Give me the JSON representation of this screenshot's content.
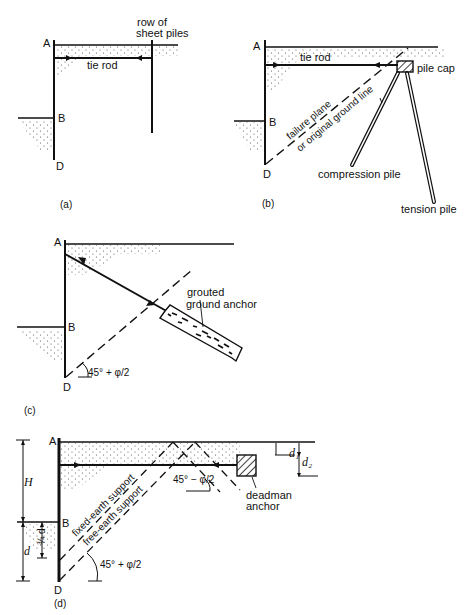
{
  "figure": {
    "panels": [
      {
        "id": "a",
        "caption": "(a)",
        "points": {
          "A": "A",
          "B": "B",
          "D": "D"
        },
        "labels": {
          "row_of_line1": "row of",
          "row_of_line2": "sheet piles",
          "tie_rod": "tie rod"
        }
      },
      {
        "id": "b",
        "caption": "(b)",
        "points": {
          "A": "A",
          "B": "B",
          "D": "D"
        },
        "labels": {
          "tie_rod": "tie rod",
          "pile_cap": "pile cap",
          "failure_plane_line1": "failure plane",
          "failure_plane_line2": "or original ground line",
          "compression_pile": "compression pile",
          "tension_pile": "tension pile"
        }
      },
      {
        "id": "c",
        "caption": "(c)",
        "points": {
          "A": "A",
          "B": "B",
          "D": "D"
        },
        "labels": {
          "anchor_line1": "grouted",
          "anchor_line2": "ground anchor",
          "angle": "45° + φ/2"
        }
      },
      {
        "id": "d",
        "caption": "(d)",
        "points": {
          "A": "A",
          "B": "B",
          "D": "D"
        },
        "labels": {
          "H": "H",
          "d": "d",
          "three_quarter_d": "¾ d",
          "d1": "d₁",
          "d2": "d₂",
          "fixed_earth": "fixed-earth support",
          "free_earth": "free-earth support",
          "angle_minus": "45° − φ/2",
          "angle_plus": "45° + φ/2",
          "deadman_line1": "deadman",
          "deadman_line2": "anchor"
        }
      }
    ]
  }
}
